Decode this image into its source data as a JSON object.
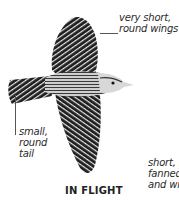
{
  "figure": {
    "caption": "IN FLIGHT"
  },
  "annotations": {
    "wings": {
      "line1": "very short,",
      "line2": "round wings"
    },
    "tail": {
      "line1": "small,",
      "line2": "round",
      "line3": "tail"
    },
    "fanned": {
      "line1": "short, r",
      "line2": "fanned",
      "line3": "and wi"
    }
  },
  "colors": {
    "ink": "#1a1a1a",
    "stripe": "#e8e8e8",
    "body_gray": "#9a9a9a",
    "text": "#2a2a2a"
  }
}
